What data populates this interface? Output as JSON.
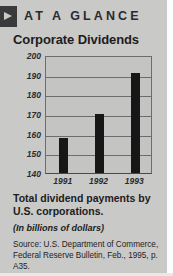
{
  "header": {
    "marker_icon": "triangle-right-icon",
    "kicker": "AT A GLANCE"
  },
  "title": "Corporate Dividends",
  "caption": "Total dividend payments by U.S. corporations.",
  "subcaption": "(In billions of dollars)",
  "source": "Source: U.S. Department of Commerce, Federal Reserve Bulletin, Feb., 1995, p. A35.",
  "colors": {
    "background": "#c9c9c7",
    "bar": "#171717",
    "marker": "#3a3a3c",
    "grid": "#6d6d6f",
    "text": "#1c1c1e"
  },
  "chart_data": {
    "type": "bar",
    "title": "Corporate Dividends",
    "subtitle": "(In billions of dollars)",
    "xlabel": "",
    "ylabel": "",
    "categories": [
      "1991",
      "1992",
      "1993"
    ],
    "values": [
      158,
      170,
      191
    ],
    "ylim": [
      140,
      200
    ],
    "yticks": [
      200,
      190,
      180,
      170,
      160,
      150,
      140
    ],
    "grid": true,
    "legend": false
  }
}
